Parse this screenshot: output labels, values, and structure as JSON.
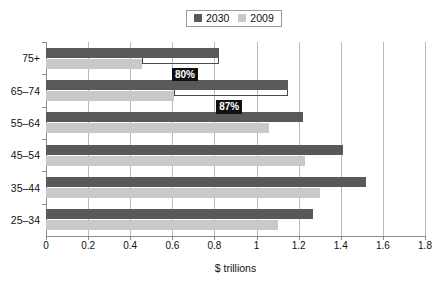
{
  "chart_data": {
    "type": "bar",
    "orientation": "horizontal",
    "title": "",
    "xlabel": "$ trillions",
    "ylabel": "",
    "xlim": [
      0,
      1.8
    ],
    "xticks": [
      0,
      0.2,
      0.4,
      0.6,
      0.8,
      1,
      1.2,
      1.4,
      1.6,
      1.8
    ],
    "xticklabels": [
      "0",
      "0.2",
      "0.4",
      "0.6",
      "0.8",
      "1",
      "1.2",
      "1.4",
      "1.6",
      "1.8"
    ],
    "grid": true,
    "grid_axis": "x",
    "legend_position": "top-center",
    "categories": [
      "75+",
      "65–74",
      "55–64",
      "45–54",
      "35–44",
      "25–34"
    ],
    "series": [
      {
        "name": "2030",
        "color": "#595959",
        "values": [
          0.82,
          1.15,
          1.22,
          1.41,
          1.52,
          1.27
        ]
      },
      {
        "name": "2009",
        "color": "#c9c9c9",
        "values": [
          0.455,
          0.61,
          1.06,
          1.23,
          1.3,
          1.1
        ]
      }
    ],
    "annotations": [
      {
        "label": "80%",
        "category": "75+",
        "from": 0.455,
        "to": 0.82,
        "box_center": 0.66
      },
      {
        "label": "87%",
        "category": "65–74",
        "from": 0.61,
        "to": 1.15,
        "box_center": 0.87
      }
    ]
  },
  "legend": {
    "items": [
      {
        "label": "2030",
        "color": "#595959"
      },
      {
        "label": "2009",
        "color": "#c9c9c9"
      }
    ]
  },
  "axis": {
    "x_title": "$ trillions"
  }
}
